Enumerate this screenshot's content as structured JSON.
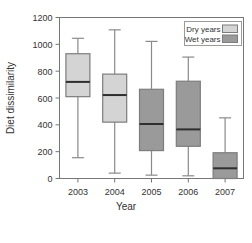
{
  "chart_data": {
    "type": "box",
    "title": "",
    "xlabel": "Year",
    "ylabel": "Diet dissimilarity",
    "categories": [
      "2003",
      "2004",
      "2005",
      "2006",
      "2007"
    ],
    "ylim": [
      0,
      1200
    ],
    "yticks": [
      0,
      200,
      400,
      600,
      800,
      1000,
      1200
    ],
    "ytick_labels": [
      "0",
      "200",
      "400",
      "600",
      "800",
      "1000",
      "1200"
    ],
    "grid": false,
    "legend_position": "top-right",
    "legend": [
      {
        "label": "Dry years",
        "color": "#d4d4d4"
      },
      {
        "label": "Wet years",
        "color": "#9a9a9a"
      }
    ],
    "boxes": [
      {
        "category": "2003",
        "group": "Dry years",
        "color": "#d4d4d4",
        "whisker_low": 155,
        "q1": 610,
        "median": 720,
        "q3": 930,
        "whisker_high": 1045
      },
      {
        "category": "2004",
        "group": "Dry years",
        "color": "#d4d4d4",
        "whisker_low": 40,
        "q1": 420,
        "median": 622,
        "q3": 778,
        "whisker_high": 1108
      },
      {
        "category": "2005",
        "group": "Wet years",
        "color": "#9a9a9a",
        "whisker_low": 25,
        "q1": 208,
        "median": 406,
        "q3": 665,
        "whisker_high": 1022
      },
      {
        "category": "2006",
        "group": "Wet years",
        "color": "#9a9a9a",
        "whisker_low": 20,
        "q1": 240,
        "median": 366,
        "q3": 725,
        "whisker_high": 905
      },
      {
        "category": "2007",
        "group": "Wet years",
        "color": "#9a9a9a",
        "whisker_low": 0,
        "q1": 0,
        "median": 76,
        "q3": 192,
        "whisker_high": 452
      }
    ]
  },
  "axes": {
    "y_title": "Diet dissimilarity",
    "x_title": "Year"
  }
}
